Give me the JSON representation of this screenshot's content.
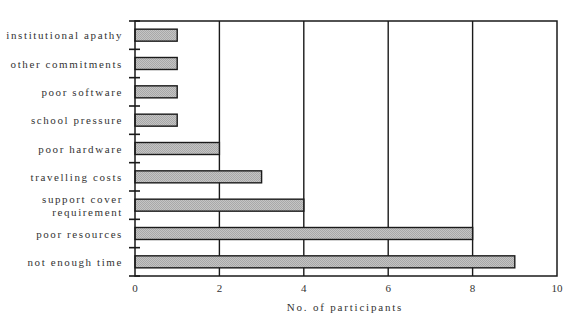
{
  "chart_data": {
    "type": "bar",
    "orientation": "horizontal",
    "title": "",
    "xlabel": "No. of participants",
    "ylabel": "",
    "xlim": [
      0,
      10
    ],
    "xticks": [
      0,
      2,
      4,
      6,
      8,
      10
    ],
    "grid": "vertical lines at each x tick",
    "legend": null,
    "categories": [
      "institutional apathy",
      "other commitments",
      "poor software",
      "school pressure",
      "poor hardware",
      "travelling costs",
      "support cover requirement",
      "poor resources",
      "not enough time"
    ],
    "category_label_lines": [
      [
        "institutional apathy"
      ],
      [
        "other commitments"
      ],
      [
        "poor software"
      ],
      [
        "school pressure"
      ],
      [
        "poor hardware"
      ],
      [
        "travelling costs"
      ],
      [
        "support cover",
        "requirement"
      ],
      [
        "poor resources"
      ],
      [
        "not enough time"
      ]
    ],
    "values": [
      1,
      1,
      1,
      1,
      2,
      3,
      4,
      8,
      9
    ]
  },
  "style": {
    "bar_fill": "#bcbcbc",
    "bar_stroke": "#1a1a1a",
    "axis_color": "#1a1a1a"
  }
}
